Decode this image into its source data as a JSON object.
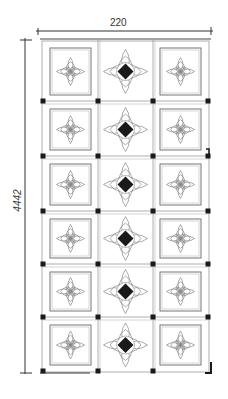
{
  "drawing": {
    "type": "ceiling-panel-elevation",
    "dimensions": {
      "width_label": "220",
      "height_label": "4442"
    },
    "grid": {
      "columns": 3,
      "rows": 6,
      "column_pattern": [
        "framed-square-with-rosette",
        "open-panel-with-rosette-and-black-diamond",
        "framed-square-with-rosette"
      ]
    },
    "colors": {
      "line": "#555555",
      "light_line": "#999999",
      "fill_black": "#1a1a1a",
      "ornament": "#888888",
      "background": "#ffffff"
    }
  }
}
